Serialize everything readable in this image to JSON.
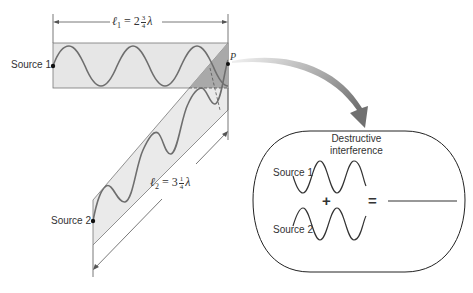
{
  "figure": {
    "path_1": {
      "source_label": "Source 1",
      "length_symbol": "ℓ",
      "length_subscript": "1",
      "length_equals": "=",
      "length_whole": "2",
      "length_num": "3",
      "length_den": "4",
      "length_unit": "λ"
    },
    "path_2": {
      "source_label": "Source 2",
      "length_symbol": "ℓ",
      "length_subscript": "2",
      "length_equals": "=",
      "length_whole": "3",
      "length_num": "1",
      "length_den": "4",
      "length_unit": "λ"
    },
    "point_label": "P",
    "inset": {
      "title_line1": "Destructive",
      "title_line2": "interference",
      "wave1_label": "Source 1",
      "wave2_label": "Source 2",
      "plus": "+",
      "equals": "="
    },
    "colors": {
      "band_fill": "#e6e6e6",
      "overlap_fill": "#a9a9a9",
      "wave": "#6e6e6e",
      "line": "#555555",
      "arrow_dark": "#7a7a7a",
      "arrow_light": "#d8d8d8"
    }
  }
}
